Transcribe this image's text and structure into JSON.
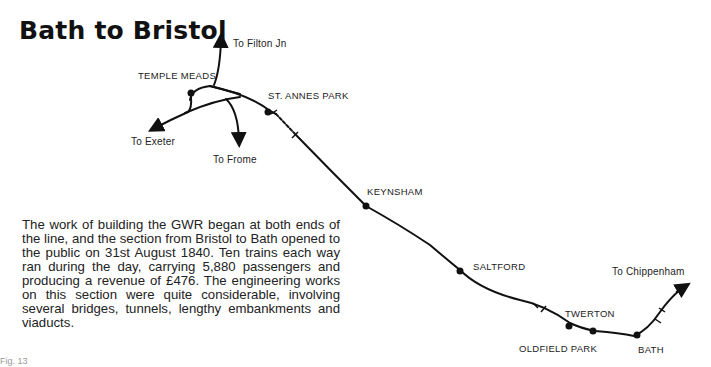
{
  "page": {
    "title": "Bath to Bristol",
    "body_text": "The work of building the GWR began at both ends of the line, and the section from Bristol to Bath opened to the public on 31st August 1840. Ten trains each way ran during the day, carrying 5,880 passengers and producing a revenue of £476. The engineering works on this section were quite considerable, involving several bridges, tunnels, lengthy embankments and viaducts.",
    "caption_partial": "Fig. 13"
  },
  "map": {
    "stations": [
      {
        "name": "TEMPLE MEADS"
      },
      {
        "name": "ST. ANNES PARK"
      },
      {
        "name": "KEYNSHAM"
      },
      {
        "name": "SALTFORD"
      },
      {
        "name": "TWERTON"
      },
      {
        "name": "OLDFIELD PARK"
      },
      {
        "name": "BATH"
      }
    ],
    "directions": [
      {
        "label": "To Filton Jn"
      },
      {
        "label": "To Exeter"
      },
      {
        "label": "To Frome"
      },
      {
        "label": "To Chippenham"
      }
    ],
    "line_color": "#111111"
  }
}
